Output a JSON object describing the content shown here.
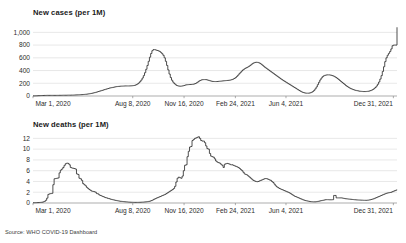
{
  "source_note": "Source: WHO COVID-19 Dashboard",
  "colors": {
    "line": "#2f2f2f",
    "grid": "#d9d9d9",
    "axis": "#8a8a8a",
    "text": "#2b2b2b",
    "background": "#ffffff"
  },
  "chart_data": [
    {
      "id": "new-cases",
      "type": "line",
      "title": "New cases (per 1M)",
      "xlabel": "",
      "ylabel": "",
      "ylim": [
        0,
        1100
      ],
      "yticks": [
        0,
        200,
        400,
        600,
        800,
        1000
      ],
      "ytick_labels": [
        "0",
        "200",
        "400",
        "600",
        "800",
        "1,000"
      ],
      "grid": true,
      "legend": "none",
      "xtick_labels": [
        "Mar 1, 2020",
        "Aug 8, 2020",
        "Nov 16, 2020",
        "Feb 24, 2021",
        "Jun 4, 2021",
        "Dec 31, 2021"
      ],
      "xtick_positions": [
        0,
        0.274,
        0.415,
        0.556,
        0.695,
        0.99
      ],
      "x_start": "Mar 1, 2020",
      "x_end": "Dec 31, 2021",
      "values": [
        2,
        2,
        3,
        4,
        5,
        6,
        7,
        8,
        8,
        9,
        9,
        10,
        10,
        10,
        10,
        10,
        10,
        10,
        10,
        10,
        10,
        11,
        11,
        11,
        12,
        12,
        12,
        12,
        13,
        13,
        13,
        14,
        14,
        15,
        16,
        17,
        18,
        19,
        20,
        21,
        22,
        24,
        26,
        28,
        30,
        33,
        36,
        40,
        44,
        48,
        53,
        58,
        64,
        70,
        76,
        82,
        88,
        94,
        100,
        106,
        112,
        118,
        124,
        128,
        132,
        136,
        140,
        144,
        148,
        150,
        152,
        154,
        155,
        156,
        157,
        158,
        158,
        158,
        158,
        159,
        160,
        162,
        165,
        170,
        178,
        190,
        205,
        225,
        250,
        282,
        320,
        366,
        420,
        480,
        545,
        610,
        668,
        712,
        730,
        728,
        722,
        716,
        710,
        700,
        685,
        665,
        640,
        600,
        545,
        480,
        410,
        345,
        290,
        248,
        218,
        195,
        178,
        165,
        158,
        155,
        154,
        156,
        160,
        166,
        172,
        176,
        178,
        180,
        181,
        182,
        184,
        188,
        195,
        205,
        218,
        232,
        244,
        252,
        256,
        258,
        258,
        256,
        252,
        246,
        240,
        234,
        230,
        228,
        227,
        227,
        228,
        230,
        232,
        234,
        236,
        238,
        240,
        242,
        244,
        246,
        248,
        252,
        258,
        266,
        276,
        290,
        308,
        328,
        350,
        372,
        392,
        410,
        424,
        436,
        446,
        456,
        468,
        482,
        498,
        512,
        522,
        528,
        530,
        528,
        522,
        512,
        498,
        482,
        466,
        450,
        436,
        422,
        408,
        394,
        380,
        366,
        352,
        338,
        324,
        310,
        296,
        282,
        268,
        255,
        242,
        230,
        218,
        206,
        194,
        182,
        170,
        158,
        146,
        134,
        122,
        110,
        98,
        86,
        74,
        64,
        56,
        50,
        46,
        44,
        44,
        46,
        50,
        58,
        70,
        88,
        112,
        142,
        178,
        216,
        252,
        282,
        304,
        318,
        326,
        330,
        332,
        332,
        330,
        326,
        320,
        312,
        302,
        290,
        276,
        260,
        244,
        228,
        212,
        196,
        180,
        164,
        150,
        138,
        126,
        116,
        108,
        100,
        94,
        88,
        84,
        80,
        76,
        74,
        72,
        70,
        70,
        70,
        72,
        74,
        78,
        84,
        92,
        102,
        116,
        134,
        156,
        184,
        220,
        266,
        320,
        386,
        460,
        540,
        600,
        640,
        670,
        700,
        740,
        790,
        800,
        800,
        800,
        1080
      ]
    },
    {
      "id": "new-deaths",
      "type": "line",
      "title": "New deaths (per 1M)",
      "xlabel": "",
      "ylabel": "",
      "ylim": [
        0,
        13
      ],
      "yticks": [
        0,
        2,
        4,
        6,
        8,
        10,
        12
      ],
      "ytick_labels": [
        "0",
        "2",
        "4",
        "6",
        "8",
        "10",
        "12"
      ],
      "grid": true,
      "legend": "none",
      "xtick_labels": [
        "Mar 1, 2020",
        "Aug 8, 2020",
        "Nov 16, 2020",
        "Feb 24, 2021",
        "Jun 4, 2021",
        "Dec 31, 2021"
      ],
      "xtick_positions": [
        0,
        0.274,
        0.415,
        0.556,
        0.695,
        0.99
      ],
      "x_start": "Mar 1, 2020",
      "x_end": "Dec 31, 2021",
      "values": [
        0.05,
        0.05,
        0.06,
        0.07,
        0.08,
        0.1,
        0.12,
        0.15,
        0.2,
        0.3,
        0.5,
        0.9,
        1.6,
        1.7,
        1.75,
        1.8,
        3.4,
        4.5,
        4.55,
        4.6,
        4.65,
        5.6,
        6.1,
        6.3,
        6.6,
        7.0,
        7.3,
        7.4,
        7.35,
        7.1,
        6.6,
        6.5,
        6.45,
        6.4,
        6.3,
        5.4,
        5.3,
        4.6,
        4.5,
        4.2,
        3.6,
        3.4,
        3.2,
        2.9,
        2.7,
        2.5,
        2.35,
        2.2,
        2.15,
        2.1,
        2.0,
        1.75,
        1.7,
        1.5,
        1.4,
        1.3,
        1.2,
        1.1,
        1.0,
        0.95,
        0.85,
        0.8,
        0.72,
        0.66,
        0.6,
        0.55,
        0.5,
        0.45,
        0.4,
        0.36,
        0.32,
        0.3,
        0.27,
        0.24,
        0.22,
        0.2,
        0.18,
        0.16,
        0.15,
        0.14,
        0.13,
        0.12,
        0.12,
        0.12,
        0.12,
        0.13,
        0.14,
        0.15,
        0.16,
        0.18,
        0.2,
        0.22,
        0.25,
        0.3,
        0.36,
        0.44,
        0.55,
        0.68,
        0.8,
        0.9,
        1.0,
        1.1,
        1.2,
        1.3,
        1.4,
        1.5,
        1.6,
        1.75,
        1.9,
        2.05,
        2.2,
        2.35,
        2.5,
        2.7,
        3.1,
        3.9,
        4.6,
        4.8,
        4.7,
        4.6,
        5.0,
        6.0,
        7.0,
        7.1,
        8.6,
        9.6,
        10.4,
        10.5,
        11.6,
        11.8,
        12.0,
        12.1,
        12.2,
        12.3,
        12.0,
        11.6,
        11.5,
        11.5,
        11.2,
        10.6,
        10.1,
        10.0,
        9.2,
        8.7,
        8.6,
        8.5,
        8.2,
        7.8,
        7.6,
        7.5,
        7.4,
        7.2,
        7.0,
        6.6,
        7.2,
        7.3,
        7.35,
        7.3,
        7.2,
        7.1,
        7.1,
        7.0,
        6.9,
        6.8,
        6.7,
        6.6,
        6.4,
        6.2,
        6.0,
        5.7,
        5.4,
        5.3,
        5.2,
        5.0,
        4.8,
        4.6,
        4.4,
        4.2,
        4.1,
        4.0,
        3.95,
        4.0,
        4.1,
        4.2,
        4.3,
        4.4,
        4.5,
        4.55,
        4.5,
        4.4,
        4.3,
        4.2,
        4.0,
        3.8,
        3.5,
        3.2,
        3.0,
        2.85,
        2.7,
        2.6,
        2.5,
        2.4,
        2.3,
        2.2,
        2.1,
        2.0,
        1.9,
        1.75,
        1.6,
        1.45,
        1.3,
        1.2,
        1.1,
        1.0,
        0.9,
        0.8,
        0.7,
        0.6,
        0.52,
        0.45,
        0.4,
        0.35,
        0.3,
        0.26,
        0.24,
        0.22,
        0.22,
        0.22,
        0.25,
        0.3,
        0.35,
        0.4,
        0.45,
        0.5,
        0.55,
        0.6,
        0.62,
        0.62,
        0.6,
        0.6,
        0.6,
        0.62,
        1.4,
        1.4,
        0.95,
        0.95,
        0.95,
        0.95,
        0.95,
        0.9,
        0.85,
        0.8,
        0.78,
        0.75,
        0.72,
        0.7,
        0.68,
        0.65,
        0.62,
        0.6,
        0.58,
        0.56,
        0.55,
        0.54,
        0.53,
        0.52,
        0.5,
        0.5,
        0.5,
        0.52,
        0.55,
        0.6,
        0.66,
        0.72,
        0.8,
        0.9,
        1.0,
        1.1,
        1.2,
        1.3,
        1.4,
        1.5,
        1.6,
        1.7,
        1.8,
        1.85,
        1.9,
        1.95,
        2.0,
        2.1,
        2.2,
        2.3,
        2.4,
        2.45
      ]
    }
  ]
}
